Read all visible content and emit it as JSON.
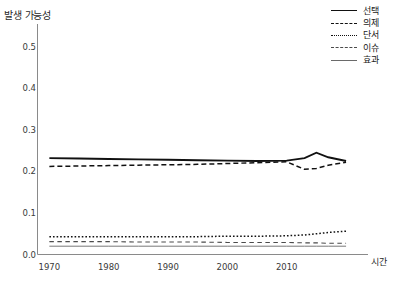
{
  "chart_data": {
    "type": "line",
    "title": "",
    "xlabel": "시간",
    "ylabel": "발생 가능성",
    "xlim": [
      1968,
      2021
    ],
    "ylim": [
      0.0,
      0.55
    ],
    "grid": false,
    "legend_position": "top-right",
    "xticks": [
      1970,
      1980,
      1990,
      2000,
      2010
    ],
    "xtick_labels": [
      "1970",
      "1980",
      "1990",
      "2000",
      "2010"
    ],
    "yticks": [
      0.0,
      0.1,
      0.2,
      0.3,
      0.4,
      0.5
    ],
    "ytick_labels": [
      "0.0",
      "0.1",
      "0.2",
      "0.3",
      "0.4",
      "0.5"
    ],
    "x": [
      1970,
      1975,
      1980,
      1985,
      1990,
      1995,
      2000,
      2005,
      2010,
      2013,
      2015,
      2017,
      2020
    ],
    "series": [
      {
        "name": "선택",
        "style": "solid",
        "width": 1.9,
        "color": "#111111",
        "values": [
          0.232,
          0.231,
          0.23,
          0.229,
          0.228,
          0.227,
          0.226,
          0.225,
          0.226,
          0.232,
          0.245,
          0.234,
          0.225
        ]
      },
      {
        "name": "의제",
        "style": "dashed",
        "width": 1.5,
        "color": "#111111",
        "values": [
          0.212,
          0.213,
          0.214,
          0.215,
          0.216,
          0.217,
          0.219,
          0.221,
          0.223,
          0.205,
          0.207,
          0.215,
          0.222
        ]
      },
      {
        "name": "단서",
        "style": "dotted",
        "width": 1.5,
        "color": "#111111",
        "values": [
          0.043,
          0.043,
          0.043,
          0.043,
          0.043,
          0.043,
          0.044,
          0.044,
          0.045,
          0.047,
          0.05,
          0.053,
          0.056
        ]
      },
      {
        "name": "이슈",
        "style": "longdash",
        "width": 1.1,
        "color": "#4a4a4a",
        "values": [
          0.031,
          0.031,
          0.031,
          0.03,
          0.03,
          0.03,
          0.029,
          0.029,
          0.029,
          0.028,
          0.028,
          0.027,
          0.027
        ]
      },
      {
        "name": "효과",
        "style": "solid",
        "width": 0.9,
        "color": "#6a6a6a",
        "values": [
          0.02,
          0.02,
          0.02,
          0.02,
          0.02,
          0.02,
          0.02,
          0.02,
          0.02,
          0.02,
          0.02,
          0.02,
          0.02
        ]
      }
    ]
  },
  "axes": {
    "y_title": "발생 가능성",
    "x_title": "시간"
  },
  "legend": {
    "items": [
      {
        "label": "선택"
      },
      {
        "label": "의제"
      },
      {
        "label": "단서"
      },
      {
        "label": "이슈"
      },
      {
        "label": "효과"
      }
    ]
  },
  "title_strip": {
    "text": ""
  }
}
